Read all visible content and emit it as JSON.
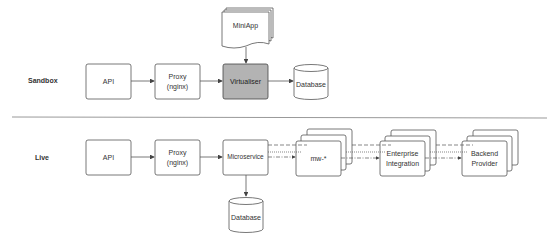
{
  "sections": {
    "sandbox": "Sandbox",
    "live": "Live"
  },
  "sandbox": {
    "miniapp": "MiniApp",
    "api": "API",
    "proxy_line1": "Proxy",
    "proxy_line2": "(nginx)",
    "virtualiser": "Virtualiser",
    "database": "Database"
  },
  "live": {
    "api": "API",
    "proxy_line1": "Proxy",
    "proxy_line2": "(nginx)",
    "microservice": "Microservice",
    "mw": "mw-*",
    "enterprise_line1": "Enterprise",
    "enterprise_line2": "Integration",
    "backend_line1": "Backend",
    "backend_line2": "Provider",
    "database": "Database"
  },
  "colors": {
    "stroke": "#555555",
    "highlight_fill": "#b3b3b3",
    "separator": "#999999"
  }
}
